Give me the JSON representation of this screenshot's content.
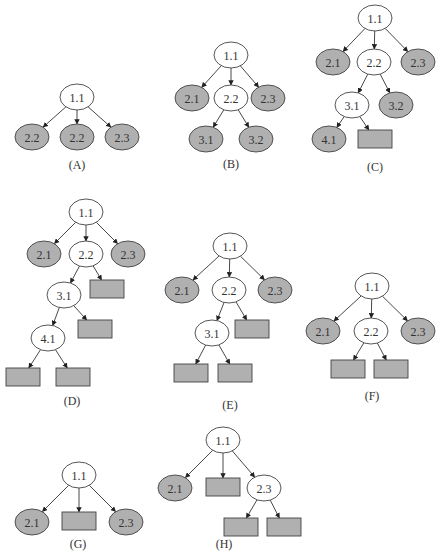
{
  "colors": {
    "edge": "#333333",
    "stroke": "#444444",
    "filled": "#b0b0b0",
    "open": "#ffffff",
    "text": "#333333"
  },
  "node_size": {
    "rx": 17,
    "ry": 13,
    "rect_w": 34,
    "rect_h": 18
  },
  "trees": [
    {
      "id": "A",
      "caption": "(A)",
      "caption_pos": [
        77,
        169
      ],
      "nodes": [
        {
          "id": "a0",
          "label": "1.1",
          "shape": "ellipse",
          "fill": "open",
          "x": 77,
          "y": 97
        },
        {
          "id": "a1",
          "label": "2.2",
          "shape": "ellipse",
          "fill": "filled",
          "x": 32,
          "y": 137
        },
        {
          "id": "a2",
          "label": "2.2",
          "shape": "ellipse",
          "fill": "filled",
          "x": 77,
          "y": 137
        },
        {
          "id": "a3",
          "label": "2.3",
          "shape": "ellipse",
          "fill": "filled",
          "x": 122,
          "y": 137
        }
      ],
      "edges": [
        [
          "a0",
          "a1"
        ],
        [
          "a0",
          "a2"
        ],
        [
          "a0",
          "a3"
        ]
      ]
    },
    {
      "id": "B",
      "caption": "(B)",
      "caption_pos": [
        231,
        168
      ],
      "nodes": [
        {
          "id": "b0",
          "label": "1.1",
          "shape": "ellipse",
          "fill": "open",
          "x": 231,
          "y": 55
        },
        {
          "id": "b1",
          "label": "2.1",
          "shape": "ellipse",
          "fill": "filled",
          "x": 192,
          "y": 98
        },
        {
          "id": "b2",
          "label": "2.2",
          "shape": "ellipse",
          "fill": "open",
          "x": 231,
          "y": 98
        },
        {
          "id": "b3",
          "label": "2.3",
          "shape": "ellipse",
          "fill": "filled",
          "x": 268,
          "y": 98
        },
        {
          "id": "b4",
          "label": "3.1",
          "shape": "ellipse",
          "fill": "filled",
          "x": 206,
          "y": 139
        },
        {
          "id": "b5",
          "label": "3.2",
          "shape": "ellipse",
          "fill": "filled",
          "x": 256,
          "y": 139
        }
      ],
      "edges": [
        [
          "b0",
          "b1"
        ],
        [
          "b0",
          "b2"
        ],
        [
          "b0",
          "b3"
        ],
        [
          "b2",
          "b4"
        ],
        [
          "b2",
          "b5"
        ]
      ]
    },
    {
      "id": "C",
      "caption": "(C)",
      "caption_pos": [
        375,
        171
      ],
      "nodes": [
        {
          "id": "c0",
          "label": "1.1",
          "shape": "ellipse",
          "fill": "open",
          "x": 375,
          "y": 18
        },
        {
          "id": "c1",
          "label": "2.1",
          "shape": "ellipse",
          "fill": "filled",
          "x": 333,
          "y": 62
        },
        {
          "id": "c2",
          "label": "2.2",
          "shape": "ellipse",
          "fill": "open",
          "x": 374,
          "y": 62
        },
        {
          "id": "c3",
          "label": "2.3",
          "shape": "ellipse",
          "fill": "filled",
          "x": 418,
          "y": 62
        },
        {
          "id": "c4",
          "label": "3.1",
          "shape": "ellipse",
          "fill": "open",
          "x": 352,
          "y": 105
        },
        {
          "id": "c5",
          "label": "3.2",
          "shape": "ellipse",
          "fill": "filled",
          "x": 396,
          "y": 105
        },
        {
          "id": "c6",
          "label": "4.1",
          "shape": "ellipse",
          "fill": "filled",
          "x": 329,
          "y": 139
        },
        {
          "id": "c7",
          "label": "",
          "shape": "rect",
          "fill": "filled",
          "x": 375,
          "y": 139
        }
      ],
      "edges": [
        [
          "c0",
          "c1"
        ],
        [
          "c0",
          "c2"
        ],
        [
          "c0",
          "c3"
        ],
        [
          "c2",
          "c4"
        ],
        [
          "c2",
          "c5"
        ],
        [
          "c4",
          "c6"
        ],
        [
          "c4",
          "c7"
        ]
      ]
    },
    {
      "id": "D",
      "caption": "(D)",
      "caption_pos": [
        72,
        405
      ],
      "nodes": [
        {
          "id": "d0",
          "label": "1.1",
          "shape": "ellipse",
          "fill": "open",
          "x": 86,
          "y": 212
        },
        {
          "id": "d1",
          "label": "2.1",
          "shape": "ellipse",
          "fill": "filled",
          "x": 44,
          "y": 254
        },
        {
          "id": "d2",
          "label": "2.2",
          "shape": "ellipse",
          "fill": "open",
          "x": 86,
          "y": 254
        },
        {
          "id": "d3",
          "label": "2.3",
          "shape": "ellipse",
          "fill": "filled",
          "x": 128,
          "y": 254
        },
        {
          "id": "d4",
          "label": "3.1",
          "shape": "ellipse",
          "fill": "open",
          "x": 64,
          "y": 295
        },
        {
          "id": "d5",
          "label": "",
          "shape": "rect",
          "fill": "filled",
          "x": 107,
          "y": 289
        },
        {
          "id": "d6",
          "label": "4.1",
          "shape": "ellipse",
          "fill": "open",
          "x": 48,
          "y": 338
        },
        {
          "id": "d7",
          "label": "",
          "shape": "rect",
          "fill": "filled",
          "x": 95,
          "y": 329
        },
        {
          "id": "d8",
          "label": "",
          "shape": "rect",
          "fill": "filled",
          "x": 23,
          "y": 377
        },
        {
          "id": "d9",
          "label": "",
          "shape": "rect",
          "fill": "filled",
          "x": 73,
          "y": 377
        }
      ],
      "edges": [
        [
          "d0",
          "d1"
        ],
        [
          "d0",
          "d2"
        ],
        [
          "d0",
          "d3"
        ],
        [
          "d2",
          "d4"
        ],
        [
          "d2",
          "d5"
        ],
        [
          "d4",
          "d6"
        ],
        [
          "d4",
          "d7"
        ],
        [
          "d6",
          "d8"
        ],
        [
          "d6",
          "d9"
        ]
      ]
    },
    {
      "id": "E",
      "caption": "(E)",
      "caption_pos": [
        230,
        409
      ],
      "nodes": [
        {
          "id": "e0",
          "label": "1.1",
          "shape": "ellipse",
          "fill": "open",
          "x": 230,
          "y": 246
        },
        {
          "id": "e1",
          "label": "2.1",
          "shape": "ellipse",
          "fill": "filled",
          "x": 182,
          "y": 290
        },
        {
          "id": "e2",
          "label": "2.2",
          "shape": "ellipse",
          "fill": "open",
          "x": 229,
          "y": 290
        },
        {
          "id": "e3",
          "label": "2.3",
          "shape": "ellipse",
          "fill": "filled",
          "x": 275,
          "y": 290
        },
        {
          "id": "e4",
          "label": "3.1",
          "shape": "ellipse",
          "fill": "open",
          "x": 212,
          "y": 333
        },
        {
          "id": "e5",
          "label": "",
          "shape": "rect",
          "fill": "filled",
          "x": 252,
          "y": 329
        },
        {
          "id": "e6",
          "label": "",
          "shape": "rect",
          "fill": "filled",
          "x": 191,
          "y": 373
        },
        {
          "id": "e7",
          "label": "",
          "shape": "rect",
          "fill": "filled",
          "x": 235,
          "y": 373
        }
      ],
      "edges": [
        [
          "e0",
          "e1"
        ],
        [
          "e0",
          "e2"
        ],
        [
          "e0",
          "e3"
        ],
        [
          "e2",
          "e4"
        ],
        [
          "e2",
          "e5"
        ],
        [
          "e4",
          "e6"
        ],
        [
          "e4",
          "e7"
        ]
      ]
    },
    {
      "id": "F",
      "caption": "(F)",
      "caption_pos": [
        372,
        400
      ],
      "nodes": [
        {
          "id": "f0",
          "label": "1.1",
          "shape": "ellipse",
          "fill": "open",
          "x": 372,
          "y": 286
        },
        {
          "id": "f1",
          "label": "2.1",
          "shape": "ellipse",
          "fill": "filled",
          "x": 323,
          "y": 331
        },
        {
          "id": "f2",
          "label": "2.2",
          "shape": "ellipse",
          "fill": "open",
          "x": 371,
          "y": 331
        },
        {
          "id": "f3",
          "label": "2.3",
          "shape": "ellipse",
          "fill": "filled",
          "x": 418,
          "y": 331
        },
        {
          "id": "f4",
          "label": "",
          "shape": "rect",
          "fill": "filled",
          "x": 348,
          "y": 369
        },
        {
          "id": "f5",
          "label": "",
          "shape": "rect",
          "fill": "filled",
          "x": 391,
          "y": 369
        }
      ],
      "edges": [
        [
          "f0",
          "f1"
        ],
        [
          "f0",
          "f2"
        ],
        [
          "f0",
          "f3"
        ],
        [
          "f2",
          "f4"
        ],
        [
          "f2",
          "f5"
        ]
      ]
    },
    {
      "id": "G",
      "caption": "(G)",
      "caption_pos": [
        78,
        548
      ],
      "nodes": [
        {
          "id": "g0",
          "label": "1.1",
          "shape": "ellipse",
          "fill": "open",
          "x": 79,
          "y": 475
        },
        {
          "id": "g1",
          "label": "2.1",
          "shape": "ellipse",
          "fill": "filled",
          "x": 32,
          "y": 522
        },
        {
          "id": "g2",
          "label": "",
          "shape": "rect",
          "fill": "filled",
          "x": 79,
          "y": 521
        },
        {
          "id": "g3",
          "label": "2.3",
          "shape": "ellipse",
          "fill": "filled",
          "x": 126,
          "y": 522
        }
      ],
      "edges": [
        [
          "g0",
          "g1"
        ],
        [
          "g0",
          "g2"
        ],
        [
          "g0",
          "g3"
        ]
      ]
    },
    {
      "id": "H",
      "caption": "(H)",
      "caption_pos": [
        224,
        548
      ],
      "nodes": [
        {
          "id": "h0",
          "label": "1.1",
          "shape": "ellipse",
          "fill": "open",
          "x": 223,
          "y": 440
        },
        {
          "id": "h1",
          "label": "2.1",
          "shape": "ellipse",
          "fill": "filled",
          "x": 175,
          "y": 488
        },
        {
          "id": "h2",
          "label": "",
          "shape": "rect",
          "fill": "filled",
          "x": 223,
          "y": 487
        },
        {
          "id": "h3",
          "label": "2.3",
          "shape": "ellipse",
          "fill": "open",
          "x": 264,
          "y": 488
        },
        {
          "id": "h4",
          "label": "",
          "shape": "rect",
          "fill": "filled",
          "x": 241,
          "y": 527
        },
        {
          "id": "h5",
          "label": "",
          "shape": "rect",
          "fill": "filled",
          "x": 284,
          "y": 527
        }
      ],
      "edges": [
        [
          "h0",
          "h1"
        ],
        [
          "h0",
          "h2"
        ],
        [
          "h0",
          "h3"
        ],
        [
          "h3",
          "h4"
        ],
        [
          "h3",
          "h5"
        ]
      ]
    }
  ]
}
